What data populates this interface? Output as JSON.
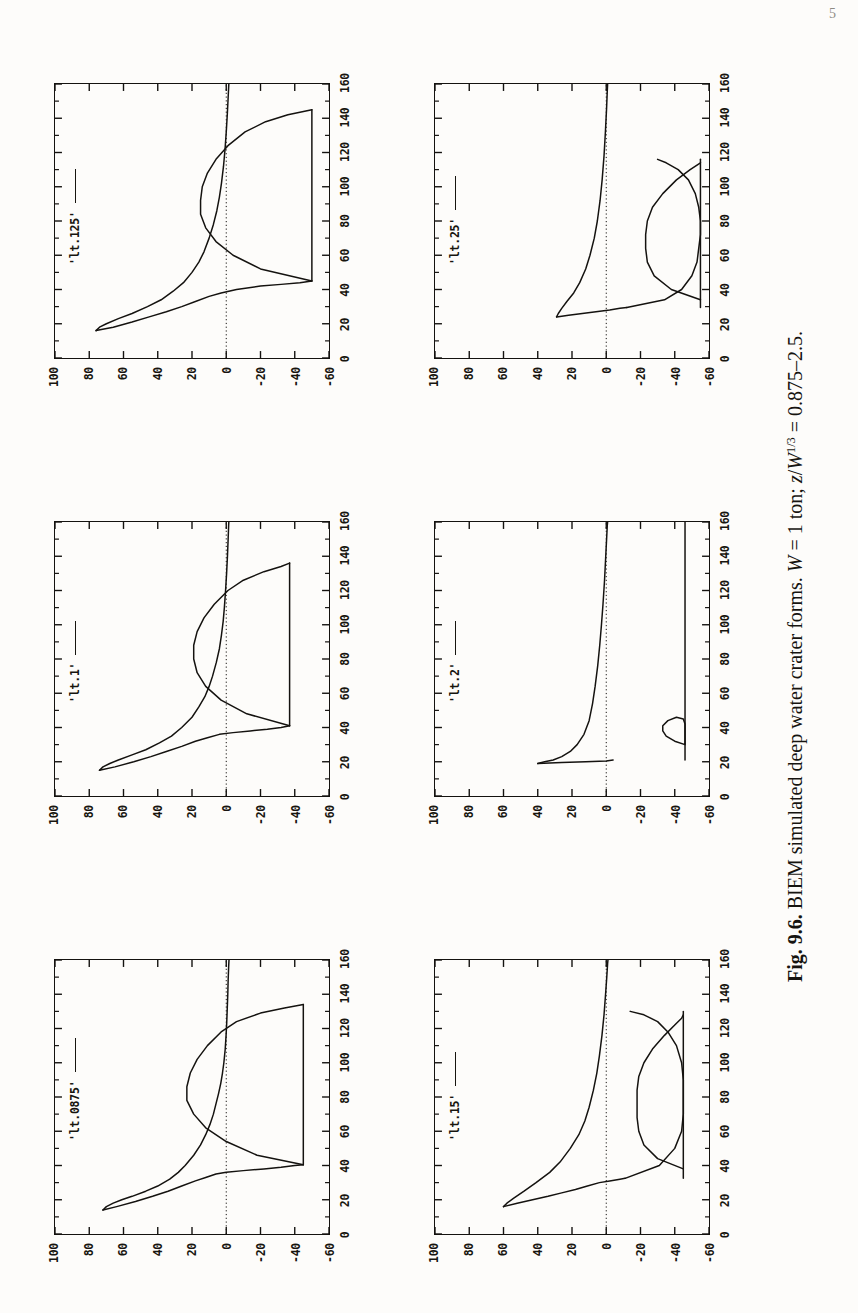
{
  "page": {
    "number": "5"
  },
  "caption": {
    "figure_number": "Fig. 9.6.",
    "text": "BIEM simulated deep water crater forms.",
    "condition_w": "W = 1 ton;",
    "condition_z": "z/W1/3 = 0.875–2.5.",
    "full": "Fig. 9.6.  BIEM simulated deep water crater forms. W = 1 ton; z/W1/3 = 0.875–2.5."
  },
  "axes": {
    "x_ticks": [
      "0",
      "20",
      "40",
      "60",
      "80",
      "100",
      "120",
      "140",
      "160"
    ],
    "x_values": [
      0,
      20,
      40,
      60,
      80,
      100,
      120,
      140,
      160
    ],
    "y_ticks": [
      "100",
      "80",
      "60",
      "40",
      "20",
      "0",
      "-20",
      "-40",
      "-60"
    ],
    "y_values": [
      100,
      80,
      60,
      40,
      20,
      0,
      -20,
      -40,
      -60
    ],
    "xlim": [
      0,
      160
    ],
    "ylim": [
      -60,
      100
    ],
    "grid": false,
    "zero_line": true
  },
  "chart_data": {
    "type": "line",
    "title": "BIEM simulated deep water crater forms",
    "xlabel": "",
    "ylabel": "",
    "xlim": [
      0,
      160
    ],
    "ylim": [
      -60,
      100
    ],
    "grid": false,
    "legend_position": "top-left",
    "panels": [
      {
        "id": "lt0875",
        "legend": "'lt.0875'",
        "row": 0,
        "col": 0,
        "series": [
          {
            "name": "crater-profile-upper",
            "comment": "outer lip / plume crest sweeping from crest near x=14,y=72 down to far field",
            "x": [
              14,
              16,
              18,
              20,
              22,
              25,
              28,
              32,
              36,
              40,
              46,
              52,
              58,
              64,
              70,
              76,
              82,
              88,
              94,
              100,
              108,
              116,
              124,
              132,
              140,
              148,
              156,
              160
            ],
            "y": [
              72,
              70,
              66,
              61,
              55,
              47,
              40,
              33,
              28,
              24,
              19,
              15,
              12,
              9.5,
              7.5,
              6,
              4.5,
              3.2,
              2.2,
              1.4,
              0.6,
              0.1,
              -0.3,
              -0.6,
              -0.9,
              -1.1,
              -1.4,
              -1.6
            ]
          },
          {
            "name": "crater-profile-lower",
            "comment": "inner crater wall: from crest x=14,y=72 sloping down through bowl to floor at x=36,y=-45",
            "x": [
              14,
              16,
              19,
              22,
              25,
              28,
              31,
              33,
              35,
              36,
              37,
              38,
              39,
              40,
              40.5
            ],
            "y": [
              72,
              64,
              53,
              43,
              34,
              26,
              18,
              12,
              6,
              0,
              -10,
              -22,
              -32,
              -40,
              -45
            ]
          },
          {
            "name": "crater-bowl",
            "comment": "bowl/bubble lobe peaking near x=78,y=23 returning to floor near x=134,y=-45",
            "x": [
              40.5,
              46,
              54,
              62,
              70,
              78,
              86,
              94,
              102,
              110,
              118,
              124,
              129,
              132,
              134
            ],
            "y": [
              -45,
              -18,
              0,
              12,
              19,
              23,
              23,
              21,
              17,
              11,
              3,
              -6,
              -20,
              -34,
              -45
            ]
          },
          {
            "name": "crater-floor",
            "comment": "flat floor segment at y=-45",
            "x": [
              40.5,
              134
            ],
            "y": [
              -45,
              -45
            ]
          }
        ]
      },
      {
        "id": "lt1",
        "legend": "'lt.1'",
        "row": 0,
        "col": 1,
        "series": [
          {
            "name": "crater-profile-upper",
            "x": [
              15,
              17,
              19,
              21,
              24,
              27,
              31,
              35,
              40,
              46,
              52,
              58,
              64,
              70,
              78,
              86,
              94,
              102,
              110,
              120,
              130,
              140,
              150,
              158,
              160
            ],
            "y": [
              74,
              72,
              68,
              63,
              55,
              47,
              39,
              32,
              26,
              20,
              16,
              12.5,
              10,
              8,
              5.8,
              4,
              2.8,
              1.8,
              1.1,
              0.4,
              -0.2,
              -0.7,
              -1.1,
              -1.4,
              -1.5
            ]
          },
          {
            "name": "crater-profile-lower",
            "x": [
              15,
              17,
              20,
              23,
              26,
              29,
              32,
              34,
              36,
              37,
              38,
              39,
              40,
              41
            ],
            "y": [
              74,
              65,
              54,
              44,
              35,
              26,
              18,
              11,
              4,
              -4,
              -14,
              -24,
              -32,
              -37
            ]
          },
          {
            "name": "crater-bowl",
            "x": [
              41,
              48,
              56,
              64,
              72,
              80,
              88,
              96,
              104,
              112,
              120,
              126,
              131,
              134,
              136
            ],
            "y": [
              -37,
              -12,
              3,
              12,
              17,
              19,
              19,
              17,
              13,
              7,
              -1,
              -10,
              -22,
              -32,
              -37
            ]
          },
          {
            "name": "crater-floor",
            "x": [
              41,
              136
            ],
            "y": [
              -37,
              -37
            ]
          }
        ]
      },
      {
        "id": "lt125",
        "legend": "'lt.125'",
        "row": 0,
        "col": 2,
        "series": [
          {
            "name": "crater-profile-upper",
            "x": [
              16,
              18,
              20,
              23,
              26,
              30,
              34,
              39,
              44,
              50,
              56,
              62,
              70,
              78,
              86,
              94,
              102,
              112,
              122,
              132,
              142,
              152,
              158,
              160
            ],
            "y": [
              76,
              74,
              70,
              63,
              55,
              46,
              38,
              31,
              25,
              20,
              16,
              13,
              10,
              7.5,
              5.5,
              4,
              2.8,
              1.6,
              0.7,
              0,
              -0.6,
              -1.1,
              -1.4,
              -1.5
            ]
          },
          {
            "name": "crater-profile-lower",
            "x": [
              16,
              18,
              21,
              24,
              27,
              30,
              33,
              36,
              38,
              40,
              42,
              43,
              44,
              45
            ],
            "y": [
              76,
              66,
              55,
              45,
              35,
              26,
              18,
              10,
              3,
              -6,
              -20,
              -32,
              -43,
              -50
            ]
          },
          {
            "name": "crater-bowl",
            "x": [
              45,
              52,
              60,
              68,
              76,
              84,
              92,
              100,
              108,
              116,
              124,
              132,
              138,
              142,
              145
            ],
            "y": [
              -50,
              -20,
              -4,
              6,
              12,
              15,
              15,
              14,
              11,
              6,
              -1,
              -11,
              -23,
              -36,
              -50
            ]
          },
          {
            "name": "crater-floor",
            "x": [
              45,
              145
            ],
            "y": [
              -50,
              -50
            ]
          }
        ]
      },
      {
        "id": "lt15",
        "legend": "'lt.15'",
        "row": 1,
        "col": 0,
        "series": [
          {
            "name": "crater-profile-upper",
            "x": [
              16,
              18,
              21,
              25,
              30,
              36,
              42,
              50,
              58,
              66,
              74,
              84,
              94,
              104,
              116,
              128,
              140,
              150,
              158,
              160
            ],
            "y": [
              60,
              58,
              54,
              48,
              41,
              33,
              27,
              21,
              16,
              12.5,
              10,
              7.5,
              5.5,
              4,
              2.5,
              1.3,
              0.4,
              -0.3,
              -0.8,
              -1.0
            ]
          },
          {
            "name": "crater-profile-lower",
            "x": [
              16,
              18,
              20,
              22,
              24,
              26,
              28,
              30,
              31,
              32,
              32.5
            ],
            "y": [
              60,
              52,
              43,
              34,
              26,
              18,
              11,
              4,
              -2,
              -8,
              -11
            ]
          },
          {
            "name": "crater-bowl",
            "x": [
              32.5,
              40,
              50,
              60,
              70,
              80,
              90,
              100,
              110,
              118,
              124,
              128,
              130
            ],
            "y": [
              -11,
              -31,
              -40,
              -44,
              -45,
              -45,
              -45,
              -44,
              -41,
              -36,
              -30,
              -22,
              -14
            ]
          },
          {
            "name": "crater-bowl-interior",
            "comment": "inner bubble lobe: from x=38 floor up to crest near x=80,y=-18 back down to x=128",
            "x": [
              38,
              44,
              52,
              60,
              68,
              76,
              84,
              92,
              100,
              108,
              116,
              122,
              126,
              128
            ],
            "y": [
              -45,
              -30,
              -22,
              -19,
              -18,
              -18,
              -18,
              -19,
              -22,
              -27,
              -34,
              -40,
              -44,
              -45
            ]
          },
          {
            "name": "crater-floor",
            "x": [
              32.5,
              130
            ],
            "y": [
              -45,
              -45
            ]
          }
        ]
      },
      {
        "id": "lt2",
        "legend": "'lt.2'",
        "row": 1,
        "col": 1,
        "series": [
          {
            "name": "crater-profile-upper",
            "comment": "steep near-vertical rise at x~20 then long shallow tail to far field",
            "x": [
              19,
              20,
              21,
              23,
              26,
              30,
              36,
              44,
              54,
              64,
              76,
              88,
              100,
              112,
              126,
              140,
              152,
              158,
              160
            ],
            "y": [
              40,
              36,
              31,
              26,
              21,
              17,
              13,
              10,
              8,
              6.5,
              5,
              3.8,
              2.8,
              1.9,
              1.0,
              0.3,
              -0.3,
              -0.6,
              -0.8
            ]
          },
          {
            "name": "crater-profile-lower",
            "x": [
              19,
              19.5,
              20,
              20.5,
              21
            ],
            "y": [
              40,
              26,
              12,
              0,
              -4
            ]
          },
          {
            "name": "crater-floor",
            "comment": "flat bottom at y=-46 out to x=160",
            "x": [
              21,
              40,
              70,
              100,
              130,
              160
            ],
            "y": [
              -46,
              -46,
              -46,
              -46,
              -46,
              -46
            ]
          },
          {
            "name": "bubble-lobe",
            "comment": "small detached loop near x=30-46 peaking at y=-32",
            "x": [
              30,
              32,
              35,
              38,
              41,
              44,
              46,
              45,
              42,
              38,
              34,
              31,
              30
            ],
            "y": [
              -46,
              -40,
              -35,
              -33,
              -33,
              -36,
              -41,
              -45,
              -46,
              -46,
              -46,
              -46,
              -46
            ]
          }
        ]
      },
      {
        "id": "lt25",
        "legend": "'lt.25'",
        "row": 1,
        "col": 2,
        "series": [
          {
            "name": "crater-profile-upper",
            "x": [
              24,
              26,
              29,
              33,
              38,
              44,
              52,
              60,
              70,
              80,
              92,
              104,
              118,
              132,
              146,
              156,
              160
            ],
            "y": [
              29,
              28,
              26,
              23,
              19,
              15.5,
              12,
              9.5,
              7,
              5.2,
              3.6,
              2.4,
              1.3,
              0.5,
              -0.2,
              -0.6,
              -0.8
            ]
          },
          {
            "name": "crater-profile-lower",
            "x": [
              24,
              25,
              26,
              27,
              28,
              29,
              29.5
            ],
            "y": [
              29,
              22,
              14,
              6,
              -2,
              -8,
              -12
            ]
          },
          {
            "name": "crater-bowl",
            "x": [
              29.5,
              34,
              40,
              48,
              56,
              64,
              72,
              80,
              88,
              96,
              104,
              110,
              114,
              116
            ],
            "y": [
              -12,
              -34,
              -44,
              -50,
              -53,
              -54,
              -55,
              -55,
              -54,
              -52,
              -48,
              -42,
              -35,
              -30
            ]
          },
          {
            "name": "crater-bowl-interior",
            "x": [
              34,
              40,
              48,
              56,
              64,
              72,
              80,
              88,
              96,
              104,
              110,
              114
            ],
            "y": [
              -55,
              -38,
              -28,
              -24,
              -23,
              -23,
              -24,
              -27,
              -33,
              -41,
              -49,
              -55
            ]
          },
          {
            "name": "crater-floor",
            "x": [
              29.5,
              116
            ],
            "y": [
              -55,
              -55
            ]
          }
        ]
      }
    ]
  }
}
